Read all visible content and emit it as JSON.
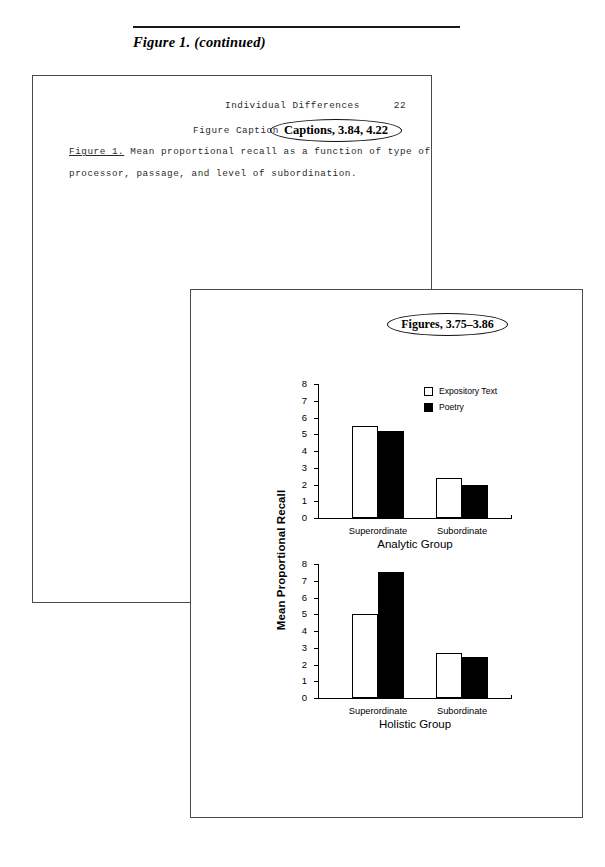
{
  "header": {
    "figure_heading": "Figure 1. (continued)"
  },
  "upper_page": {
    "running_head": "Individual Differences",
    "page_number": "22",
    "caption_heading": "Figure Caption",
    "caption_label": "Figure 1.",
    "caption_line1_rest": " Mean proportional recall as a function of type of",
    "caption_line2": "processor, passage, and level of subordination.",
    "annotation": "Captions, 3.84, 4.22"
  },
  "lower_page": {
    "annotation": "Figures, 3.75–3.86"
  },
  "chart_data": [
    {
      "type": "bar",
      "title": "Analytic Group",
      "xlabel": "Analytic Group",
      "ylabel": "Mean Proportional Recall",
      "categories": [
        "Superordinate",
        "Subordinate"
      ],
      "yticks": [
        "8",
        "7",
        "6",
        "5",
        "4",
        "3",
        "2",
        "1",
        "0"
      ],
      "ylim": [
        0,
        8
      ],
      "grid": false,
      "legend_position": "top-right",
      "series": [
        {
          "name": "Expository Text",
          "color": "#ffffff",
          "values": [
            5.45,
            2.4
          ]
        },
        {
          "name": "Poetry",
          "color": "#000000",
          "values": [
            5.2,
            1.95
          ]
        }
      ]
    },
    {
      "type": "bar",
      "title": "Holistic Group",
      "xlabel": "Holistic Group",
      "ylabel": "Mean Proportional Recall",
      "categories": [
        "Superordinate",
        "Subordinate"
      ],
      "yticks": [
        "8",
        "7",
        "6",
        "5",
        "4",
        "3",
        "2",
        "1",
        "0"
      ],
      "ylim": [
        0,
        8
      ],
      "grid": false,
      "legend_position": "none",
      "series": [
        {
          "name": "Expository Text",
          "color": "#ffffff",
          "values": [
            5.0,
            2.65
          ]
        },
        {
          "name": "Poetry",
          "color": "#000000",
          "values": [
            7.5,
            2.45
          ]
        }
      ]
    }
  ]
}
